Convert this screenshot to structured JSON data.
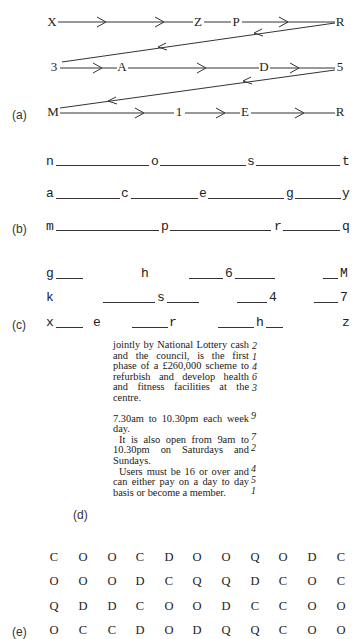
{
  "section_a": {
    "label": "(a)",
    "rows": [
      {
        "chars": [
          "X",
          "Z",
          "P",
          "R"
        ]
      },
      {
        "chars": [
          "3",
          "A",
          "D",
          "5"
        ]
      },
      {
        "chars": [
          "M",
          "1",
          "E",
          "R"
        ]
      }
    ]
  },
  "section_b": {
    "label": "(b)",
    "rows": [
      {
        "chars": [
          "n",
          "o",
          "s",
          "t"
        ]
      },
      {
        "chars": [
          "a",
          "c",
          "e",
          "g",
          "y"
        ]
      },
      {
        "chars": [
          "m",
          "p",
          "r",
          "q"
        ]
      }
    ]
  },
  "section_c": {
    "label": "(c)",
    "rows": [
      {
        "chars": [
          "g",
          "h",
          "6",
          "M"
        ]
      },
      {
        "chars": [
          "k",
          "s",
          "4",
          "7"
        ]
      },
      {
        "chars": [
          "x",
          "e",
          "r",
          "h",
          "z"
        ]
      }
    ]
  },
  "section_d": {
    "label": "(d)",
    "paragraphs": [
      "jointly by National Lottery cash and the council, is the first phase of a £260,000 scheme to refurbish and develop health and fitness facilities at the centre.",
      "7.30am to 10.30pm each week day.",
      "It is also open from 9am to 10.30pm on Saturdays and Sundays.",
      "Users must be 16 or over and can either pay on a day to day basis or become a member."
    ],
    "margin_numbers": [
      "2",
      "1",
      "4",
      "6",
      "3",
      "9",
      "7",
      "2",
      "4",
      "5",
      "1"
    ]
  },
  "section_e": {
    "label": "(e)",
    "rows": [
      [
        "C",
        "O",
        "O",
        "C",
        "D",
        "O",
        "O",
        "Q",
        "O",
        "D",
        "C"
      ],
      [
        "O",
        "O",
        "O",
        "D",
        "C",
        "Q",
        "Q",
        "D",
        "C",
        "O",
        "C"
      ],
      [
        "Q",
        "D",
        "D",
        "C",
        "O",
        "O",
        "D",
        "C",
        "C",
        "O",
        "O"
      ],
      [
        "O",
        "C",
        "C",
        "D",
        "O",
        "D",
        "Q",
        "Q",
        "C",
        "O",
        "O"
      ]
    ]
  }
}
